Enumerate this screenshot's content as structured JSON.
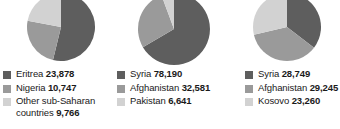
{
  "chart_data": [
    {
      "type": "pie",
      "title": "",
      "categories": [
        "Eritrea",
        "Nigeria",
        "Other sub-Saharan countries"
      ],
      "values": [
        23878,
        10747,
        9766
      ],
      "value_labels": [
        "23,878",
        "10,747",
        "9,766"
      ],
      "colors": [
        "#5e5e5e",
        "#9a9a9a",
        "#d2d2d2"
      ],
      "legend_position": "bottom",
      "start_angle_deg": 0,
      "slice_fractions": [
        0.538,
        0.242,
        0.22
      ]
    },
    {
      "type": "pie",
      "title": "",
      "categories": [
        "Syria",
        "Afghanistan",
        "Pakistan"
      ],
      "values": [
        78190,
        32581,
        6641
      ],
      "value_labels": [
        "78,190",
        "32,581",
        "6,641"
      ],
      "colors": [
        "#5e5e5e",
        "#9a9a9a",
        "#d2d2d2"
      ],
      "legend_position": "bottom",
      "start_angle_deg": 0,
      "slice_fractions": [
        0.666,
        0.277,
        0.057
      ]
    },
    {
      "type": "pie",
      "title": "",
      "categories": [
        "Syria",
        "Afghanistan",
        "Kosovo"
      ],
      "values": [
        28749,
        29245,
        23260
      ],
      "value_labels": [
        "28,749",
        "29,245",
        "23,260"
      ],
      "colors": [
        "#5e5e5e",
        "#9a9a9a",
        "#d2d2d2"
      ],
      "legend_position": "bottom",
      "start_angle_deg": 0,
      "slice_fractions": [
        0.354,
        0.36,
        0.286
      ]
    }
  ],
  "panels": [
    {
      "legend": [
        {
          "label": "Eritrea",
          "value": "23,878",
          "color": "#5e5e5e"
        },
        {
          "label": "Nigeria",
          "value": "10,747",
          "color": "#9a9a9a"
        },
        {
          "label": "Other sub-Saharan\ncountries",
          "value": "9,766",
          "color": "#d2d2d2"
        }
      ]
    },
    {
      "legend": [
        {
          "label": "Syria",
          "value": "78,190",
          "color": "#5e5e5e"
        },
        {
          "label": "Afghanistan",
          "value": "32,581",
          "color": "#9a9a9a"
        },
        {
          "label": "Pakistan",
          "value": "6,641",
          "color": "#d2d2d2"
        }
      ]
    },
    {
      "legend": [
        {
          "label": "Syria",
          "value": "28,749",
          "color": "#5e5e5e"
        },
        {
          "label": "Afghanistan",
          "value": "29,245",
          "color": "#9a9a9a"
        },
        {
          "label": "Kosovo",
          "value": "23,260",
          "color": "#d2d2d2"
        }
      ]
    }
  ]
}
